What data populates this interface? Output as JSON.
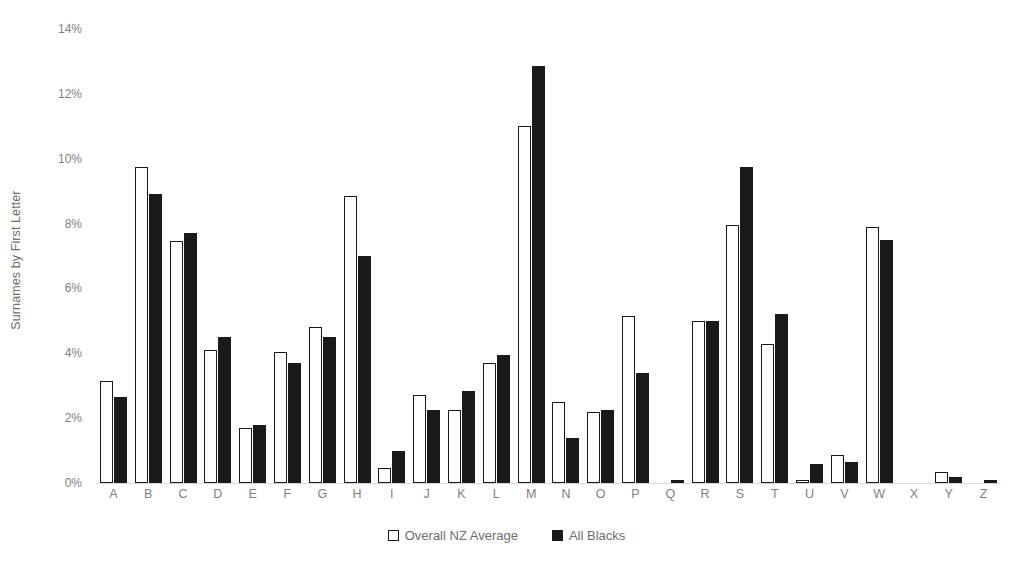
{
  "chart_data": {
    "type": "bar",
    "title": "",
    "subtitle": "",
    "xlabel": "",
    "ylabel": "Surnames by First Letter",
    "ylim": [
      0,
      14
    ],
    "ytick_labels": [
      "14%",
      "12%",
      "10%",
      "8%",
      "6%",
      "4%",
      "2%",
      "0%"
    ],
    "ytick_values": [
      14,
      12,
      10,
      8,
      6,
      4,
      2,
      0
    ],
    "grid": false,
    "legend_position": "bottom",
    "value_unit": "%",
    "categories": [
      "A",
      "B",
      "C",
      "D",
      "E",
      "F",
      "G",
      "H",
      "I",
      "J",
      "K",
      "L",
      "M",
      "N",
      "O",
      "P",
      "Q",
      "R",
      "S",
      "T",
      "U",
      "V",
      "W",
      "X",
      "Y",
      "Z"
    ],
    "series": [
      {
        "name": "Overall NZ Average",
        "color": "#ffffff",
        "edge_color": "#1a1a1a",
        "values": [
          3.15,
          9.75,
          7.45,
          4.1,
          1.7,
          4.05,
          4.8,
          8.85,
          0.45,
          2.7,
          2.25,
          3.7,
          11.0,
          2.5,
          2.2,
          5.15,
          0.0,
          5.0,
          7.95,
          4.3,
          0.1,
          0.85,
          7.9,
          0.0,
          0.35,
          0.0
        ]
      },
      {
        "name": "All Blacks",
        "color": "#1a1a1a",
        "edge_color": "#1a1a1a",
        "values": [
          2.65,
          8.9,
          7.7,
          4.5,
          1.8,
          3.7,
          4.5,
          7.0,
          1.0,
          2.25,
          2.85,
          3.95,
          12.85,
          1.4,
          2.25,
          3.4,
          0.1,
          5.0,
          9.75,
          5.2,
          0.6,
          0.65,
          7.5,
          0.0,
          0.2,
          0.1
        ]
      }
    ]
  }
}
